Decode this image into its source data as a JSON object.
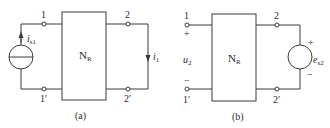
{
  "figure": {
    "a": {
      "caption": "(a)",
      "network_label": "N",
      "network_sub": "R",
      "terminals": {
        "t1": "1",
        "t1p": "1′",
        "t2": "2",
        "t2p": "2′"
      },
      "source": {
        "name": "i",
        "sub": "s1",
        "type": "current-source"
      },
      "branch_current": {
        "name": "i",
        "sub": "1"
      }
    },
    "b": {
      "caption": "(b)",
      "network_label": "N",
      "network_sub": "R",
      "terminals": {
        "t1": "1",
        "t1p": "1′",
        "t2": "2",
        "t2p": "2′"
      },
      "open_voltage": {
        "name": "u",
        "sub": "2",
        "plus": "+",
        "minus": "−"
      },
      "source": {
        "name": "e",
        "sub": "s2",
        "type": "voltage-source",
        "plus": "+",
        "minus": "−"
      }
    }
  }
}
